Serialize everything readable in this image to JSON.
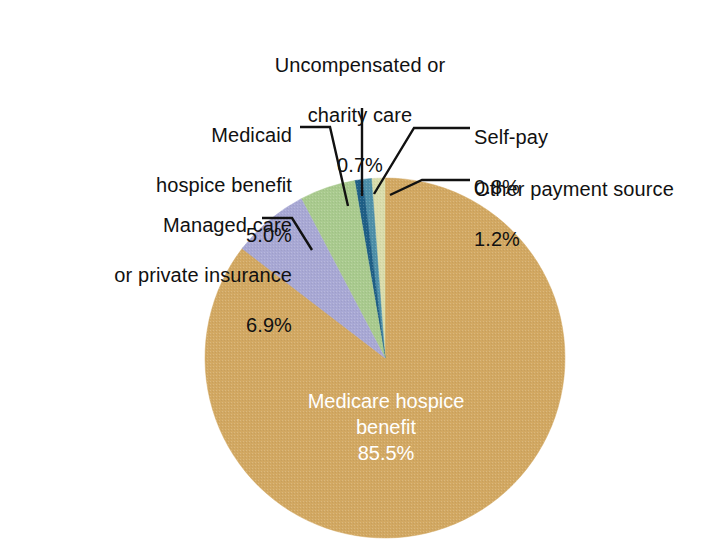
{
  "chart_data": {
    "type": "pie",
    "title": "",
    "subtitle": "",
    "xlabel": "",
    "ylabel": "",
    "legend_position": "none",
    "grid": false,
    "value_unit": "percent",
    "categories": [
      "Medicare hospice benefit",
      "Other payment source",
      "Self-pay",
      "Uncompensated or charity care",
      "Medicaid hospice benefit",
      "Managed care or private insurance"
    ],
    "values": [
      85.5,
      1.2,
      0.8,
      0.7,
      5.0,
      6.9
    ],
    "value_labels": [
      "85.5%",
      "1.2%",
      "0.8%",
      "0.7%",
      "5.0%",
      "6.9%"
    ],
    "colors": [
      "#d2a862",
      "#d9dcab",
      "#4d8fa8",
      "#1f5f86",
      "#a9ca8e",
      "#a8a8d4"
    ],
    "slices": [
      {
        "name": "medicare-hospice-benefit",
        "label_line1": "Medicare hospice",
        "label_line2": "benefit",
        "percent": "85.5%",
        "value": 85.5,
        "color": "#d2a862",
        "label_placement": "inside",
        "label_color": "#ffffff"
      },
      {
        "name": "other-payment-source",
        "label_line1": "Other payment  source",
        "label_line2": "",
        "percent": "1.2%",
        "value": 1.2,
        "color": "#d9dcab",
        "label_placement": "outside-right",
        "label_color": "#111111"
      },
      {
        "name": "self-pay",
        "label_line1": "Self-pay",
        "label_line2": "",
        "percent": "0.8%",
        "value": 0.8,
        "color": "#4d8fa8",
        "label_placement": "outside-right",
        "label_color": "#111111"
      },
      {
        "name": "uncompensated-or-charity-care",
        "label_line1": "Uncompensated or",
        "label_line2": "charity care",
        "percent": "0.7%",
        "value": 0.7,
        "color": "#1f5f86",
        "label_placement": "outside-top",
        "label_color": "#111111"
      },
      {
        "name": "medicaid-hospice-benefit",
        "label_line1": "Medicaid",
        "label_line2": "hospice benefit",
        "percent": "5.0%",
        "value": 5.0,
        "color": "#a9ca8e",
        "label_placement": "outside-left",
        "label_color": "#111111"
      },
      {
        "name": "managed-care-or-private-insurance",
        "label_line1": "Managed care",
        "label_line2": "or private  insurance",
        "percent": "6.9%",
        "value": 6.9,
        "color": "#a8a8d4",
        "label_placement": "outside-left",
        "label_color": "#111111"
      }
    ]
  },
  "labels": {
    "uncompensated": {
      "line1": "Uncompensated or",
      "line2": "charity care",
      "percent": "0.7%"
    },
    "medicaid": {
      "line1": "Medicaid",
      "line2": "hospice benefit",
      "percent": "5.0%"
    },
    "managed": {
      "line1": "Managed care",
      "line2": "or private  insurance",
      "percent": "6.9%"
    },
    "selfpay": {
      "line1": "Self-pay",
      "percent": "0.8%"
    },
    "other": {
      "line1": "Other payment  source",
      "percent": "1.2%"
    },
    "medicare": {
      "line1": "Medicare hospice",
      "line2": "benefit",
      "percent": "85.5%"
    }
  },
  "figure": {
    "background_color": "#ffffff",
    "leader_line_color": "#111111"
  }
}
